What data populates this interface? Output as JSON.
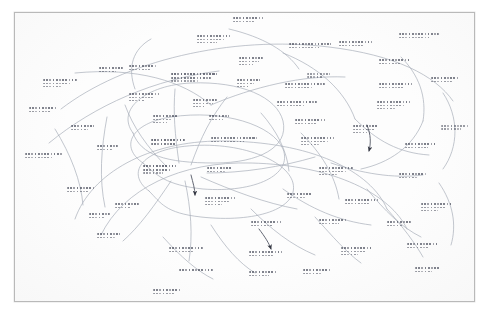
{
  "document": {
    "kind": "scanned-handwritten-concept-map",
    "medium": "ink pen on white paper",
    "legibility": "illegible",
    "frame": {
      "visible": true,
      "style": "thin rectangular ruled border",
      "color": "#b9b9b9"
    },
    "colors": {
      "page_background": "#ffffff",
      "sheet_background": "#fdfdfd",
      "ink": "#4a4e5c",
      "ink_dark": "#2b2e3a",
      "frame_border": "#b9b9b9",
      "connector": "#9aa0ae"
    },
    "counts": {
      "text_clusters": 45,
      "connector_curves": 34,
      "arrowheads": 3
    }
  },
  "nodes": [
    {
      "id": "n1",
      "x": 232,
      "y": 10,
      "w": 30,
      "lines": 2,
      "text": ""
    },
    {
      "id": "n2",
      "x": 196,
      "y": 28,
      "w": 34,
      "lines": 3,
      "text": ""
    },
    {
      "id": "n3",
      "x": 288,
      "y": 36,
      "w": 42,
      "lines": 2,
      "text": ""
    },
    {
      "id": "n4",
      "x": 338,
      "y": 34,
      "w": 36,
      "lines": 2,
      "text": ""
    },
    {
      "id": "n5",
      "x": 398,
      "y": 26,
      "w": 40,
      "lines": 2,
      "text": ""
    },
    {
      "id": "n6",
      "x": 378,
      "y": 52,
      "w": 34,
      "lines": 2,
      "text": ""
    },
    {
      "id": "n7",
      "x": 238,
      "y": 50,
      "w": 22,
      "lines": 3,
      "text": ""
    },
    {
      "id": "n8",
      "x": 128,
      "y": 58,
      "w": 30,
      "lines": 2,
      "text": ""
    },
    {
      "id": "n9",
      "x": 42,
      "y": 72,
      "w": 34,
      "lines": 3,
      "text": ""
    },
    {
      "id": "n10",
      "x": 98,
      "y": 60,
      "w": 26,
      "lines": 2,
      "text": ""
    },
    {
      "id": "n11",
      "x": 170,
      "y": 66,
      "w": 48,
      "lines": 3,
      "text": ""
    },
    {
      "id": "n12",
      "x": 236,
      "y": 72,
      "w": 22,
      "lines": 3,
      "text": ""
    },
    {
      "id": "n13",
      "x": 284,
      "y": 76,
      "w": 40,
      "lines": 2,
      "text": ""
    },
    {
      "id": "n14",
      "x": 306,
      "y": 66,
      "w": 26,
      "lines": 2,
      "text": ""
    },
    {
      "id": "n15",
      "x": 378,
      "y": 76,
      "w": 34,
      "lines": 2,
      "text": ""
    },
    {
      "id": "n16",
      "x": 430,
      "y": 70,
      "w": 32,
      "lines": 2,
      "text": ""
    },
    {
      "id": "n17",
      "x": 128,
      "y": 86,
      "w": 30,
      "lines": 3,
      "text": ""
    },
    {
      "id": "n18",
      "x": 192,
      "y": 92,
      "w": 26,
      "lines": 3,
      "text": ""
    },
    {
      "id": "n19",
      "x": 276,
      "y": 94,
      "w": 40,
      "lines": 2,
      "text": ""
    },
    {
      "id": "n20",
      "x": 376,
      "y": 94,
      "w": 34,
      "lines": 3,
      "text": ""
    },
    {
      "id": "n21",
      "x": 28,
      "y": 100,
      "w": 32,
      "lines": 2,
      "text": ""
    },
    {
      "id": "n22",
      "x": 152,
      "y": 108,
      "w": 26,
      "lines": 3,
      "text": ""
    },
    {
      "id": "n23",
      "x": 208,
      "y": 108,
      "w": 22,
      "lines": 2,
      "text": ""
    },
    {
      "id": "n24",
      "x": 294,
      "y": 112,
      "w": 30,
      "lines": 2,
      "text": ""
    },
    {
      "id": "n25",
      "x": 352,
      "y": 118,
      "w": 28,
      "lines": 3,
      "text": ""
    },
    {
      "id": "n26",
      "x": 440,
      "y": 118,
      "w": 30,
      "lines": 2,
      "text": ""
    },
    {
      "id": "n27",
      "x": 70,
      "y": 118,
      "w": 26,
      "lines": 2,
      "text": ""
    },
    {
      "id": "n28",
      "x": 96,
      "y": 138,
      "w": 22,
      "lines": 2,
      "text": ""
    },
    {
      "id": "n29",
      "x": 150,
      "y": 132,
      "w": 34,
      "lines": 2,
      "text": ""
    },
    {
      "id": "n30",
      "x": 210,
      "y": 130,
      "w": 46,
      "lines": 2,
      "text": ""
    },
    {
      "id": "n31",
      "x": 300,
      "y": 130,
      "w": 34,
      "lines": 3,
      "text": ""
    },
    {
      "id": "n32",
      "x": 404,
      "y": 136,
      "w": 34,
      "lines": 2,
      "text": ""
    },
    {
      "id": "n33",
      "x": 24,
      "y": 146,
      "w": 38,
      "lines": 2,
      "text": ""
    },
    {
      "id": "n34",
      "x": 142,
      "y": 158,
      "w": 34,
      "lines": 3,
      "text": ""
    },
    {
      "id": "n35",
      "x": 206,
      "y": 160,
      "w": 28,
      "lines": 2,
      "text": ""
    },
    {
      "id": "n36",
      "x": 318,
      "y": 160,
      "w": 34,
      "lines": 3,
      "text": ""
    },
    {
      "id": "n37",
      "x": 398,
      "y": 166,
      "w": 30,
      "lines": 2,
      "text": ""
    },
    {
      "id": "n38",
      "x": 66,
      "y": 180,
      "w": 30,
      "lines": 2,
      "text": ""
    },
    {
      "id": "n39",
      "x": 114,
      "y": 196,
      "w": 26,
      "lines": 2,
      "text": ""
    },
    {
      "id": "n40",
      "x": 204,
      "y": 190,
      "w": 30,
      "lines": 3,
      "text": ""
    },
    {
      "id": "n41",
      "x": 286,
      "y": 186,
      "w": 28,
      "lines": 2,
      "text": ""
    },
    {
      "id": "n42",
      "x": 344,
      "y": 192,
      "w": 34,
      "lines": 2,
      "text": ""
    },
    {
      "id": "n43",
      "x": 420,
      "y": 196,
      "w": 34,
      "lines": 3,
      "text": ""
    },
    {
      "id": "n44",
      "x": 88,
      "y": 206,
      "w": 22,
      "lines": 2,
      "text": ""
    },
    {
      "id": "n45",
      "x": 96,
      "y": 226,
      "w": 26,
      "lines": 2,
      "text": ""
    },
    {
      "id": "n46",
      "x": 250,
      "y": 214,
      "w": 30,
      "lines": 2,
      "text": ""
    },
    {
      "id": "n47",
      "x": 318,
      "y": 212,
      "w": 30,
      "lines": 2,
      "text": ""
    },
    {
      "id": "n48",
      "x": 386,
      "y": 214,
      "w": 26,
      "lines": 2,
      "text": ""
    },
    {
      "id": "n49",
      "x": 168,
      "y": 240,
      "w": 34,
      "lines": 2,
      "text": ""
    },
    {
      "id": "n50",
      "x": 248,
      "y": 244,
      "w": 34,
      "lines": 2,
      "text": ""
    },
    {
      "id": "n51",
      "x": 340,
      "y": 240,
      "w": 32,
      "lines": 3,
      "text": ""
    },
    {
      "id": "n52",
      "x": 406,
      "y": 236,
      "w": 34,
      "lines": 2,
      "text": ""
    },
    {
      "id": "n53",
      "x": 178,
      "y": 262,
      "w": 34,
      "lines": 1,
      "text": ""
    },
    {
      "id": "n54",
      "x": 248,
      "y": 264,
      "w": 30,
      "lines": 2,
      "text": ""
    },
    {
      "id": "n55",
      "x": 302,
      "y": 262,
      "w": 30,
      "lines": 2,
      "text": ""
    },
    {
      "id": "n56",
      "x": 152,
      "y": 282,
      "w": 30,
      "lines": 2,
      "text": ""
    },
    {
      "id": "n57",
      "x": 414,
      "y": 260,
      "w": 28,
      "lines": 2,
      "text": ""
    }
  ]
}
